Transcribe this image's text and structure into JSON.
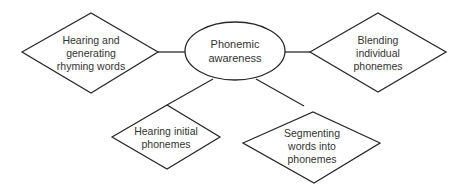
{
  "diagram": {
    "type": "concept-map",
    "center": {
      "id": "phonemic-awareness",
      "lines": [
        "Phonemic",
        "awareness"
      ],
      "shape": "ellipse"
    },
    "nodes": [
      {
        "id": "rhyming",
        "lines": [
          "Hearing and",
          "generating",
          "rhyming words"
        ],
        "shape": "diamond"
      },
      {
        "id": "blending",
        "lines": [
          "Blending",
          "individual",
          "phonemes"
        ],
        "shape": "diamond"
      },
      {
        "id": "initial",
        "lines": [
          "Hearing initial",
          "phonemes"
        ],
        "shape": "diamond"
      },
      {
        "id": "segmenting",
        "lines": [
          "Segmenting",
          "words into",
          "phonemes"
        ],
        "shape": "diamond"
      }
    ],
    "edges": [
      {
        "from": "phonemic-awareness",
        "to": "rhyming"
      },
      {
        "from": "phonemic-awareness",
        "to": "blending"
      },
      {
        "from": "phonemic-awareness",
        "to": "initial"
      },
      {
        "from": "phonemic-awareness",
        "to": "segmenting"
      }
    ],
    "colors": {
      "stroke": "#2a2a2a",
      "text": "#333333",
      "background": "#ffffff"
    }
  }
}
